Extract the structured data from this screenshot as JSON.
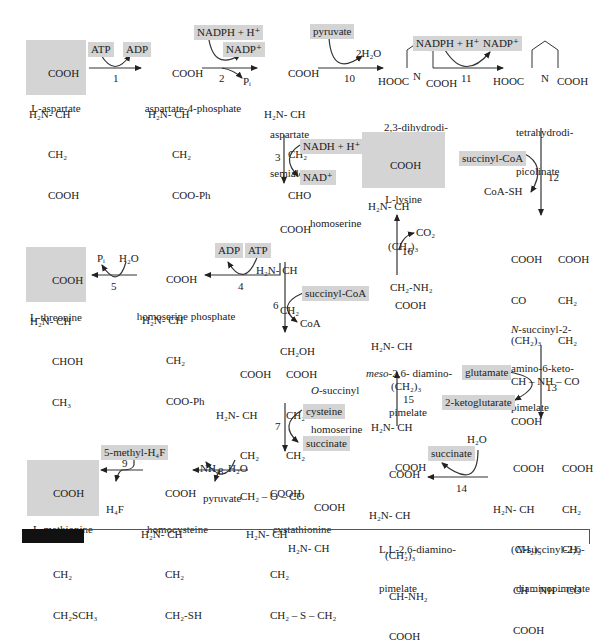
{
  "highlight_color": "#d4d4d4",
  "compounds": {
    "aspartate": {
      "lines": [
        "COOH",
        "H₂N- CH",
        "CH₂",
        "COOH"
      ],
      "name": "L-aspartate"
    },
    "aspartate_4_phosphate": {
      "lines": [
        "COOH",
        "H₂N- CH",
        "CH₂",
        "COO-Ph"
      ],
      "name": "aspartate-4-phosphate"
    },
    "aspartate_semialdehyde": {
      "lines": [
        "COOH",
        "H₂N- CH",
        "CH₂",
        "CHO"
      ],
      "name_lines": [
        "aspartate",
        "semialdehyde"
      ]
    },
    "dihydrodipicolinate": {
      "left": "HOOC",
      "ring_n": "N",
      "right": "COOH",
      "name_lines": [
        "2,3-dihydrodi-",
        "picolinate"
      ]
    },
    "tetrahydrodipicolinate": {
      "left": "HOOC",
      "ring_n": "N",
      "right": "COOH",
      "name_lines": [
        "tetrahydrodi-",
        "picolinate"
      ]
    },
    "lysine": {
      "lines": [
        "COOH",
        "H₂N- CH",
        "(CH₂)₃",
        "CH₂-NH₂"
      ],
      "name": "L-lysine"
    },
    "homoserine": {
      "lines": [
        "COOH",
        "H₂N- CH",
        "CH₂",
        "CH₂OH"
      ],
      "name": "homoserine"
    },
    "homoserine_phosphate": {
      "lines": [
        "COOH",
        "H₂N- CH",
        "CH₂",
        "COO-Ph"
      ],
      "name": "homoserine phosphate"
    },
    "threonine": {
      "lines": [
        "COOH",
        "H₂N- CH",
        "CHOH",
        "CH₃"
      ],
      "name": "L-threonine"
    },
    "o_succinyl_homoserine": {
      "left_lines": [
        "COOH",
        "H₂N- CH",
        "CH₂",
        "CH₂ – O – CO"
      ],
      "right_lines": [
        "COOH",
        "CH₂",
        "CH₂"
      ],
      "name_lines": [
        "O-succinyl",
        "homoserine"
      ]
    },
    "meso_diaminopimelate": {
      "lines": [
        "COOH",
        "H₂N- CH",
        "(CH₂)₃",
        "H₂N- CH",
        "COOH"
      ],
      "name_prefix": "meso",
      "name_rest": "-2,6- diamino-",
      "name_line2": "pimelate"
    },
    "n_succinyl_2_amino_6_ketopimelate": {
      "left_lines": [
        "COOH",
        "CO",
        "(CH₂)₃",
        "CH – NH – CO",
        "COOH"
      ],
      "right_lines": [
        "COOH",
        "CH₂",
        "CH₂"
      ],
      "name_prefix": "N",
      "name_rest": "-succinyl-2-",
      "name_line2": "amino-6-keto-",
      "name_line3": "pimelate"
    },
    "n_succinyl_2_6_diaminopimelate": {
      "left_lines": [
        "COOH",
        "H₂N- CH",
        "(CH₂)₃",
        "CH – NH – CO",
        "COOH"
      ],
      "right_lines": [
        "COOH",
        "CH₂",
        "CH₂"
      ],
      "name_prefix": "N",
      "name_rest": "-succinyl-2,6-",
      "name_line2": "diaminopimelate"
    },
    "ll_diaminopimelate": {
      "lines": [
        "COOH",
        "H₂N- CH",
        "(CH₂)₃",
        "CH-NH₂",
        "COOH"
      ],
      "name_lines": [
        "L,L-2,6-diamino-",
        "pimelate"
      ]
    },
    "cystathionine": {
      "left_lines": [
        "COOH",
        "H₂N- CH",
        "CH₂",
        "CH₂ – S – CH₂"
      ],
      "right_lines": [
        "COOH",
        "H₂N- CH"
      ],
      "name": "cystathionine"
    },
    "homocysteine": {
      "lines": [
        "COOH",
        "H₂N- CH",
        "CH₂",
        "CH₂-SH"
      ],
      "name": "homocysteine"
    },
    "methionine": {
      "lines": [
        "COOH",
        "H₂N- CH",
        "CH₂",
        "CH₂SCH₃"
      ],
      "name": "L-methionine"
    }
  },
  "reactions": [
    {
      "step": "1",
      "in": "ATP",
      "out": "ADP"
    },
    {
      "step": "2",
      "in": "NADPH + H⁺",
      "out": "NADP⁺",
      "side": "Pᵢ"
    },
    {
      "step": "10",
      "in": "pyruvate",
      "out": "2H₂O"
    },
    {
      "step": "11",
      "in": "NADPH + H⁺",
      "out": "NADP⁺"
    },
    {
      "step": "3",
      "in": "NADH + H⁺",
      "out": "NAD⁺"
    },
    {
      "step": "12",
      "in": "succinyl-CoA",
      "out": "CoA-SH"
    },
    {
      "step": "4",
      "in": "ATP",
      "out": "ADP"
    },
    {
      "step": "5",
      "in": "H₂O",
      "out": "Pᵢ"
    },
    {
      "step": "6",
      "in": "succinyl-CoA",
      "out": "CoA"
    },
    {
      "step": "16",
      "out": "CO₂"
    },
    {
      "step": "13",
      "in": "glutamate",
      "out": "2-ketoglutarate"
    },
    {
      "step": "15"
    },
    {
      "step": "7",
      "in": "cysteine",
      "out": "succinate"
    },
    {
      "step": "14",
      "in": "H₂O",
      "out": "succinate"
    },
    {
      "step": "8",
      "in": "H₂O",
      "out_a": "NH₃",
      "out_b": "pyruvate"
    },
    {
      "step": "9",
      "in": "5-methyl-H₄F",
      "out": "H₄F"
    }
  ]
}
